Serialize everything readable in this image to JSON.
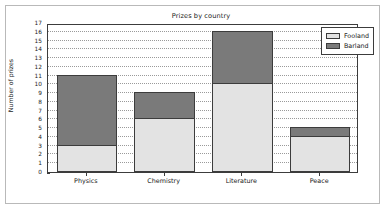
{
  "chart_data": {
    "type": "bar",
    "subtype": "stacked-vertical",
    "title": "Prizes by country",
    "xlabel": "",
    "ylabel": "Number of prizes",
    "categories": [
      "Physics",
      "Chemistry",
      "Literature",
      "Peace"
    ],
    "series": [
      {
        "name": "Fooland",
        "color": "#e3e3e3",
        "values": [
          3,
          6,
          10,
          4
        ]
      },
      {
        "name": "Barland",
        "color": "#7a7a7a",
        "values": [
          8,
          3,
          6,
          1
        ]
      }
    ],
    "totals": [
      11,
      9,
      16,
      5
    ],
    "ylim": [
      0,
      17
    ],
    "ytick_values": [
      0,
      1,
      2,
      3,
      4,
      5,
      6,
      7,
      8,
      9,
      10,
      11,
      12,
      13,
      14,
      15,
      16,
      17
    ],
    "ytick_labels": [
      "0",
      "1",
      "2",
      "3",
      "4",
      "5",
      "6",
      "7",
      "8",
      "9",
      "10",
      "11",
      "12",
      "13",
      "14",
      "15",
      "16",
      "17"
    ],
    "grid": true,
    "grid_axis": "y",
    "grid_style": "dotted",
    "legend_position": "upper right",
    "legend_entries": [
      "Fooland",
      "Barland"
    ]
  },
  "figure": {
    "background_color": "#ffffff",
    "border_color": "#b9b9b9",
    "axes_color": "#3c3c3c"
  }
}
